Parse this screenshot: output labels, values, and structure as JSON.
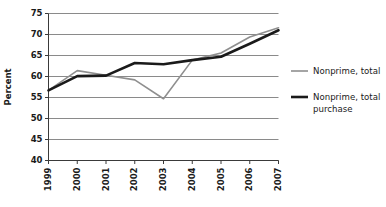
{
  "chart_data": {
    "type": "line",
    "title": "",
    "subtitle": "",
    "xlabel": "",
    "ylabel": "Percent",
    "categories": [
      "1999",
      "2000",
      "2001",
      "2002",
      "2003",
      "2004",
      "2005",
      "2006",
      "2007"
    ],
    "x": [
      1999,
      2000,
      2001,
      2002,
      2003,
      2004,
      2005,
      2006,
      2007
    ],
    "ylim": [
      40,
      75
    ],
    "yticks": [
      40,
      45,
      50,
      55,
      60,
      65,
      70,
      75
    ],
    "ytick_labels": [
      "40",
      "45",
      "50",
      "55",
      "60",
      "65",
      "70",
      "75"
    ],
    "xtick_labels": [
      "1999",
      "2000",
      "2001",
      "2002",
      "2003",
      "2004",
      "2005",
      "2006",
      "2007"
    ],
    "grid": true,
    "grid_axis": "y",
    "legend_position": "right",
    "series": [
      {
        "name": "Nonprime, total",
        "color": "#8f8f8f",
        "width": 1.6,
        "values": [
          56.7,
          61.4,
          60.3,
          59.2,
          54.7,
          63.9,
          65.6,
          69.4,
          71.6
        ]
      },
      {
        "name": "Nonprime, total purchase",
        "color": "#1a1a1a",
        "width": 2.6,
        "values": [
          56.7,
          60.1,
          60.2,
          63.2,
          62.9,
          63.9,
          64.7,
          67.8,
          71.0
        ]
      }
    ]
  },
  "legend": {
    "items": [
      {
        "label_line1": "Nonprime, total",
        "label_line2": ""
      },
      {
        "label_line1": "Nonprime, total",
        "label_line2": "purchase"
      }
    ]
  },
  "axes": {
    "y_title": "Percent"
  }
}
